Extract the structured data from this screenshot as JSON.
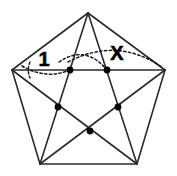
{
  "figure": {
    "background_color": "#ffffff",
    "line_color": "#2b2b2b",
    "dot_color": "#000000",
    "arc_color": "#1a1a1a",
    "shape": "pentagon",
    "labels": {
      "angle_one": "1",
      "angle_x": "X"
    },
    "outer_vertices": [
      {
        "name": "top-apex",
        "x": 88,
        "y": 13
      },
      {
        "name": "right-upper",
        "x": 165,
        "y": 70
      },
      {
        "name": "right-lower",
        "x": 137,
        "y": 164
      },
      {
        "name": "left-lower",
        "x": 40,
        "y": 164
      },
      {
        "name": "left-upper",
        "x": 12,
        "y": 70
      }
    ],
    "inner_points": [
      {
        "name": "inner-left-top",
        "x": 70,
        "y": 70
      },
      {
        "name": "inner-right-top",
        "x": 107,
        "y": 70
      },
      {
        "name": "inner-left",
        "x": 58,
        "y": 107
      },
      {
        "name": "inner-right",
        "x": 118,
        "y": 107
      },
      {
        "name": "inner-bottom",
        "x": 90,
        "y": 131
      }
    ],
    "arcs": [
      {
        "name": "angle-one-arc-small",
        "path": "M 30 62 A 20 20 0 0 0 30 78"
      },
      {
        "name": "angle-one-arc-wide",
        "path": "M 22 66 Q 46 80 70 70"
      },
      {
        "name": "angle-x-arc-inner",
        "path": "M 59 62 Q 85 44 107 70"
      },
      {
        "name": "angle-x-arc-outer",
        "path": "M 68 62 Q 118 36 163 68"
      }
    ]
  }
}
